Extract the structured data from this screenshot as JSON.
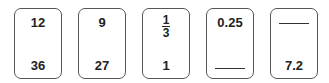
{
  "cards": [
    {
      "top": "12",
      "bottom": "36"
    },
    {
      "top": "9",
      "bottom": "27"
    },
    {
      "top": {
        "numerator": "1",
        "denominator": "3"
      },
      "bottom": "1"
    },
    {
      "top": "0.25",
      "bottom": ""
    },
    {
      "top": "",
      "bottom": "7.2"
    }
  ]
}
